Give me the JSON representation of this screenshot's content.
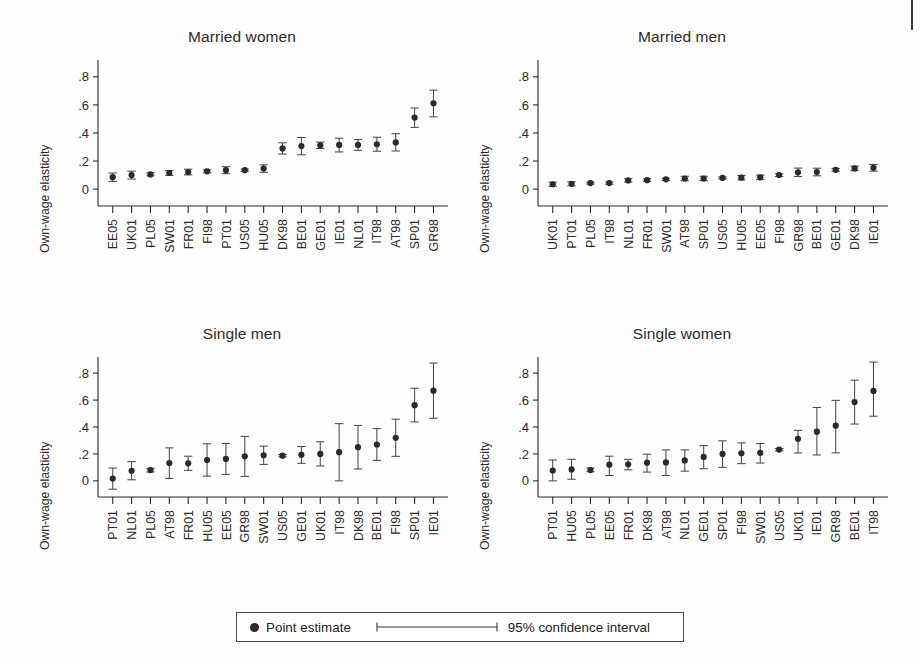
{
  "figure": {
    "background": "#fdfdfc",
    "ink": "#2b2b2b",
    "marker_color": "#2a2a2a"
  },
  "legend": {
    "point_estimate_label": "Point estimate",
    "ci_label": "95% confidence interval"
  },
  "chart_data": [
    {
      "type": "scatter",
      "title": "Married women",
      "xlabel": "",
      "ylabel": "Own-wage elasticity",
      "ylim": [
        -0.12,
        0.92
      ],
      "yticks": [
        0,
        0.2,
        0.4,
        0.6,
        0.8
      ],
      "ytick_labels": [
        "0",
        ".2",
        ".4",
        ".6",
        ".8"
      ],
      "grid": false,
      "categories": [
        "EE05",
        "UK01",
        "PL05",
        "SW01",
        "FR01",
        "FI98",
        "PT01",
        "US05",
        "HU05",
        "DK98",
        "BE01",
        "GE01",
        "IE01",
        "NL01",
        "IT98",
        "AT98",
        "SP01",
        "GR98"
      ],
      "values": [
        0.085,
        0.1,
        0.105,
        0.115,
        0.122,
        0.127,
        0.135,
        0.135,
        0.147,
        0.29,
        0.307,
        0.312,
        0.315,
        0.315,
        0.32,
        0.333,
        0.51,
        0.612
      ],
      "ci_low": [
        0.055,
        0.072,
        0.095,
        0.098,
        0.102,
        0.117,
        0.11,
        0.127,
        0.12,
        0.25,
        0.245,
        0.29,
        0.265,
        0.277,
        0.27,
        0.272,
        0.44,
        0.515
      ],
      "ci_high": [
        0.115,
        0.128,
        0.117,
        0.133,
        0.142,
        0.138,
        0.16,
        0.143,
        0.173,
        0.33,
        0.368,
        0.335,
        0.363,
        0.353,
        0.37,
        0.395,
        0.578,
        0.705
      ]
    },
    {
      "type": "scatter",
      "title": "Married men",
      "xlabel": "",
      "ylabel": "Own-wage elasticity",
      "ylim": [
        -0.12,
        0.92
      ],
      "yticks": [
        0,
        0.2,
        0.4,
        0.6,
        0.8
      ],
      "ytick_labels": [
        "0",
        ".2",
        ".4",
        ".6",
        ".8"
      ],
      "grid": false,
      "categories": [
        "UK01",
        "PT01",
        "PL05",
        "IT98",
        "NL01",
        "FR01",
        "SW01",
        "AT98",
        "SP01",
        "US05",
        "HU05",
        "EE05",
        "FI98",
        "GR98",
        "BE01",
        "GE01",
        "DK98",
        "IE01"
      ],
      "values": [
        0.035,
        0.038,
        0.043,
        0.043,
        0.062,
        0.064,
        0.07,
        0.076,
        0.076,
        0.08,
        0.082,
        0.084,
        0.1,
        0.12,
        0.122,
        0.138,
        0.148,
        0.152
      ],
      "ci_low": [
        0.02,
        0.024,
        0.036,
        0.035,
        0.05,
        0.055,
        0.062,
        0.06,
        0.06,
        0.073,
        0.066,
        0.068,
        0.09,
        0.09,
        0.095,
        0.128,
        0.132,
        0.128
      ],
      "ci_high": [
        0.05,
        0.052,
        0.05,
        0.051,
        0.074,
        0.073,
        0.078,
        0.092,
        0.092,
        0.087,
        0.098,
        0.1,
        0.11,
        0.15,
        0.149,
        0.148,
        0.164,
        0.176
      ]
    },
    {
      "type": "scatter",
      "title": "Single men",
      "xlabel": "",
      "ylabel": "Own-wage elasticity",
      "ylim": [
        -0.12,
        0.92
      ],
      "yticks": [
        0,
        0.2,
        0.4,
        0.6,
        0.8
      ],
      "ytick_labels": [
        "0",
        ".2",
        ".4",
        ".6",
        ".8"
      ],
      "grid": false,
      "categories": [
        "PT01",
        "NL01",
        "PL05",
        "AT98",
        "FR01",
        "HU05",
        "EE05",
        "GR98",
        "SW01",
        "US05",
        "GE01",
        "UK01",
        "IT98",
        "DK98",
        "BE01",
        "FI98",
        "SP01",
        "IE01"
      ],
      "values": [
        0.017,
        0.075,
        0.08,
        0.132,
        0.13,
        0.155,
        0.163,
        0.182,
        0.19,
        0.187,
        0.193,
        0.2,
        0.213,
        0.25,
        0.27,
        0.32,
        0.562,
        0.67
      ],
      "ci_low": [
        -0.062,
        0.008,
        0.066,
        0.018,
        0.078,
        0.035,
        0.048,
        0.033,
        0.122,
        0.178,
        0.13,
        0.11,
        0.0,
        0.088,
        0.152,
        0.182,
        0.438,
        0.465
      ],
      "ci_high": [
        0.095,
        0.143,
        0.093,
        0.245,
        0.183,
        0.275,
        0.278,
        0.33,
        0.258,
        0.196,
        0.255,
        0.29,
        0.425,
        0.412,
        0.388,
        0.458,
        0.688,
        0.875
      ]
    },
    {
      "type": "scatter",
      "title": "Single women",
      "xlabel": "",
      "ylabel": "Own-wage elasticity",
      "ylim": [
        -0.12,
        0.92
      ],
      "yticks": [
        0,
        0.2,
        0.4,
        0.6,
        0.8
      ],
      "ytick_labels": [
        "0",
        ".2",
        ".4",
        ".6",
        ".8"
      ],
      "grid": false,
      "categories": [
        "PT01",
        "HU05",
        "PL05",
        "EE05",
        "FR01",
        "DK98",
        "AT98",
        "NL01",
        "GE01",
        "SP01",
        "FI98",
        "SW01",
        "US05",
        "UK01",
        "IE01",
        "GR98",
        "BE01",
        "IT98"
      ],
      "values": [
        0.077,
        0.085,
        0.08,
        0.12,
        0.123,
        0.135,
        0.137,
        0.152,
        0.178,
        0.2,
        0.205,
        0.208,
        0.232,
        0.312,
        0.365,
        0.41,
        0.585,
        0.668
      ],
      "ci_low": [
        0.0,
        0.012,
        0.068,
        0.04,
        0.082,
        0.065,
        0.04,
        0.072,
        0.09,
        0.1,
        0.128,
        0.132,
        0.222,
        0.207,
        0.192,
        0.208,
        0.422,
        0.48
      ],
      "ci_high": [
        0.155,
        0.16,
        0.095,
        0.183,
        0.16,
        0.198,
        0.23,
        0.23,
        0.262,
        0.297,
        0.282,
        0.277,
        0.24,
        0.375,
        0.545,
        0.598,
        0.748,
        0.882
      ]
    }
  ]
}
